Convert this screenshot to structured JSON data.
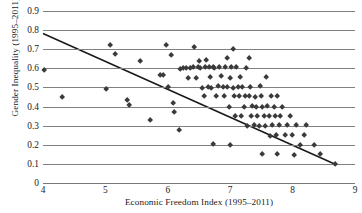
{
  "chart_data": {
    "type": "scatter",
    "title": "",
    "xlabel": "Economic Freedom Index (1995–2011)",
    "ylabel": "Gender Inequality (1995–2011)",
    "xlim": [
      4,
      9
    ],
    "ylim": [
      0,
      0.9
    ],
    "xticks": [
      "4",
      "5",
      "6",
      "7",
      "8",
      "9"
    ],
    "yticks": [
      "0",
      "0.1",
      "0.2",
      "0.3",
      "0.4",
      "0.5",
      "0.6",
      "0.7",
      "0.8",
      "0.9"
    ],
    "grid": "horizontal",
    "legend": "none",
    "marker_style": "diamond",
    "marker_color": "#3a3a3a",
    "gridline_color": "#808080",
    "trendline": {
      "type": "linear",
      "color": "#1a1a1a",
      "x_start": 4.0,
      "y_start": 0.782,
      "x_end": 8.7,
      "y_end": 0.095
    },
    "points": [
      [
        4.02,
        0.592
      ],
      [
        4.3,
        0.447
      ],
      [
        5.01,
        0.492
      ],
      [
        5.08,
        0.722
      ],
      [
        5.15,
        0.672
      ],
      [
        5.35,
        0.432
      ],
      [
        5.38,
        0.407
      ],
      [
        5.55,
        0.635
      ],
      [
        5.72,
        0.327
      ],
      [
        5.88,
        0.562
      ],
      [
        5.92,
        0.563
      ],
      [
        5.98,
        0.722
      ],
      [
        6.0,
        0.503
      ],
      [
        6.05,
        0.668
      ],
      [
        6.08,
        0.418
      ],
      [
        6.1,
        0.372
      ],
      [
        6.18,
        0.278
      ],
      [
        6.2,
        0.598
      ],
      [
        6.25,
        0.6
      ],
      [
        6.3,
        0.603
      ],
      [
        6.33,
        0.548
      ],
      [
        6.36,
        0.602
      ],
      [
        6.4,
        0.606
      ],
      [
        6.42,
        0.712
      ],
      [
        6.45,
        0.547
      ],
      [
        6.48,
        0.604
      ],
      [
        6.5,
        0.637
      ],
      [
        6.52,
        0.601
      ],
      [
        6.55,
        0.498
      ],
      [
        6.58,
        0.452
      ],
      [
        6.6,
        0.605
      ],
      [
        6.62,
        0.641
      ],
      [
        6.64,
        0.503
      ],
      [
        6.66,
        0.607
      ],
      [
        6.68,
        0.553
      ],
      [
        6.7,
        0.498
      ],
      [
        6.72,
        0.607
      ],
      [
        6.74,
        0.602
      ],
      [
        6.78,
        0.452
      ],
      [
        6.8,
        0.508
      ],
      [
        6.82,
        0.608
      ],
      [
        6.85,
        0.56
      ],
      [
        6.88,
        0.5
      ],
      [
        6.9,
        0.452
      ],
      [
        6.92,
        0.605
      ],
      [
        6.95,
        0.503
      ],
      [
        6.98,
        0.398
      ],
      [
        7.0,
        0.551
      ],
      [
        7.02,
        0.605
      ],
      [
        7.04,
        0.497
      ],
      [
        7.06,
        0.452
      ],
      [
        7.08,
        0.352
      ],
      [
        7.1,
        0.604
      ],
      [
        7.12,
        0.5
      ],
      [
        7.14,
        0.452
      ],
      [
        7.16,
        0.553
      ],
      [
        7.18,
        0.348
      ],
      [
        7.2,
        0.502
      ],
      [
        7.22,
        0.398
      ],
      [
        7.24,
        0.452
      ],
      [
        7.26,
        0.601
      ],
      [
        7.28,
        0.297
      ],
      [
        7.3,
        0.452
      ],
      [
        7.32,
        0.5
      ],
      [
        7.34,
        0.352
      ],
      [
        7.36,
        0.403
      ],
      [
        7.38,
        0.3
      ],
      [
        7.4,
        0.45
      ],
      [
        7.42,
        0.398
      ],
      [
        7.44,
        0.352
      ],
      [
        7.46,
        0.298
      ],
      [
        7.48,
        0.504
      ],
      [
        7.5,
        0.452
      ],
      [
        7.52,
        0.398
      ],
      [
        7.54,
        0.35
      ],
      [
        7.56,
        0.298
      ],
      [
        7.58,
        0.553
      ],
      [
        7.6,
        0.4
      ],
      [
        7.62,
        0.352
      ],
      [
        7.64,
        0.246
      ],
      [
        7.66,
        0.452
      ],
      [
        7.68,
        0.3
      ],
      [
        7.7,
        0.398
      ],
      [
        7.72,
        0.35
      ],
      [
        7.74,
        0.252
      ],
      [
        7.76,
        0.452
      ],
      [
        7.78,
        0.3
      ],
      [
        7.8,
        0.352
      ],
      [
        7.84,
        0.398
      ],
      [
        7.88,
        0.248
      ],
      [
        7.92,
        0.3
      ],
      [
        7.96,
        0.352
      ],
      [
        8.0,
        0.25
      ],
      [
        8.05,
        0.3
      ],
      [
        8.12,
        0.198
      ],
      [
        8.18,
        0.252
      ],
      [
        8.22,
        0.3
      ],
      [
        8.35,
        0.198
      ],
      [
        8.45,
        0.152
      ],
      [
        8.68,
        0.098
      ],
      [
        6.95,
        0.652
      ],
      [
        7.05,
        0.7
      ],
      [
        7.3,
        0.652
      ],
      [
        6.72,
        0.202
      ],
      [
        7.0,
        0.2
      ],
      [
        7.52,
        0.15
      ],
      [
        7.75,
        0.152
      ],
      [
        8.02,
        0.148
      ]
    ]
  }
}
